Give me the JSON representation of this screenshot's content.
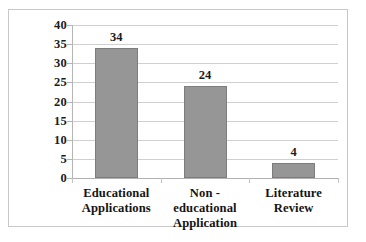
{
  "chart_data": {
    "type": "bar",
    "title": "",
    "subtitle": "",
    "xlabel": "",
    "ylabel": "",
    "categories": [
      "Educational Applications",
      "Non -educational Application",
      "Literature Review"
    ],
    "category_lines": [
      [
        "Educational",
        "Applications"
      ],
      [
        "Non -educational",
        "Application"
      ],
      [
        "Literature",
        "Review"
      ]
    ],
    "values": [
      34,
      24,
      4
    ],
    "value_labels": [
      "34",
      "24",
      "4"
    ],
    "ylim": [
      0,
      40
    ],
    "ytick_step": 5,
    "ytick_labels": [
      "40",
      "35",
      "30",
      "25",
      "20",
      "15",
      "10",
      "5",
      "0"
    ],
    "ytick_values": [
      40,
      35,
      30,
      25,
      20,
      15,
      10,
      5,
      0
    ],
    "grid": true,
    "grid_axis": "y",
    "legend": false,
    "legend_position": "none",
    "orientation": "vertical"
  },
  "style": {
    "bar_fill": "#969696",
    "bar_stroke": "#7d7d7d",
    "gridline_color": "#d0d0d0",
    "axis_color": "#b5b5b5",
    "frame_border": "#c8c8c8",
    "background": "#ffffff",
    "text_color": "#1b1b1b"
  }
}
